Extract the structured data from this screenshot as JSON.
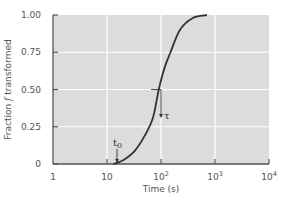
{
  "chart_data": {
    "type": "line",
    "title": "",
    "xlabel": "Time (s)",
    "ylabel": "Fraction f transformed",
    "ylabel_parts": {
      "pre": "Fraction ",
      "italic": "f",
      "post": " transformed"
    },
    "xscale": "log",
    "xlim": [
      1,
      10000
    ],
    "ylim": [
      0,
      1.0
    ],
    "x_ticks": [
      {
        "value": 1,
        "base": "1",
        "exp": ""
      },
      {
        "value": 10,
        "base": "10",
        "exp": ""
      },
      {
        "value": 100,
        "base": "10",
        "exp": "2"
      },
      {
        "value": 1000,
        "base": "10",
        "exp": "3"
      },
      {
        "value": 10000,
        "base": "10",
        "exp": "4"
      }
    ],
    "y_ticks": [
      {
        "value": 0,
        "label": "0"
      },
      {
        "value": 0.25,
        "label": "0.25"
      },
      {
        "value": 0.5,
        "label": "0.50"
      },
      {
        "value": 0.75,
        "label": "0.75"
      },
      {
        "value": 1.0,
        "label": "1.00"
      }
    ],
    "grid": true,
    "legend": null,
    "series": [
      {
        "name": "fraction transformed",
        "x": [
          13,
          15.3,
          21,
          33,
          50,
          71,
          91,
          115,
          148,
          224,
          389,
          708
        ],
        "y": [
          0,
          0.007,
          0.03,
          0.09,
          0.19,
          0.31,
          0.5,
          0.64,
          0.745,
          0.9,
          0.98,
          1.0
        ]
      }
    ],
    "annotations": [
      {
        "label": "t",
        "subscript": "0",
        "x": 15.3,
        "y": 0.0,
        "type": "arrow-down",
        "meaning": "start time"
      },
      {
        "label": "τ",
        "x": 100,
        "y": 0.5,
        "type": "arrow-down",
        "meaning": "time to 50% transformed"
      }
    ]
  },
  "style": {
    "plot_bg": "#dcdcdc",
    "grid_color": "#ffffff",
    "axis_color": "#555555",
    "curve_color": "#333333"
  }
}
